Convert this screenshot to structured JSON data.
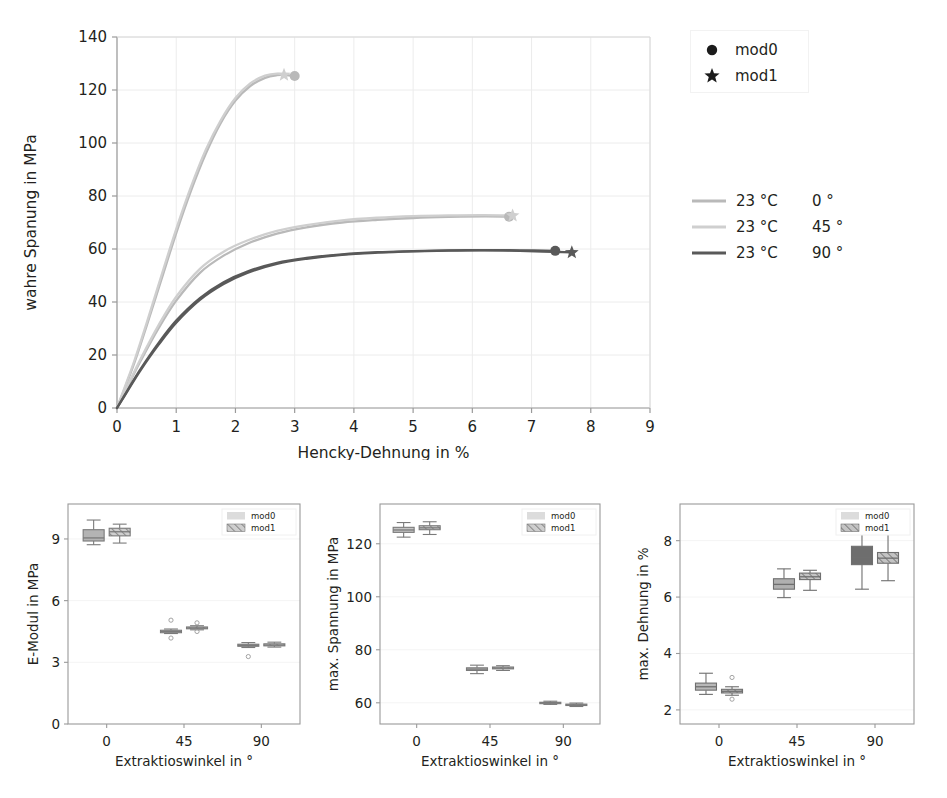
{
  "figure": {
    "kind": "multi-panel-scientific-figure",
    "panel_count": 4
  },
  "chart_data": [
    {
      "id": "stress-strain",
      "type": "line",
      "title": "",
      "xlabel": "Hencky-Dehnung in %",
      "ylabel": "wahre Spanung in MPa",
      "xlim": [
        0,
        9
      ],
      "ylim": [
        0,
        140
      ],
      "xticks": [
        "0",
        "1",
        "2",
        "3",
        "4",
        "5",
        "6",
        "7",
        "8",
        "9"
      ],
      "yticks": [
        "0",
        "20",
        "40",
        "60",
        "80",
        "100",
        "120",
        "140"
      ],
      "grid": true,
      "legend_position": "outside-right",
      "marker_legend": [
        {
          "label": "mod0",
          "marker": "circle"
        },
        {
          "label": "mod1",
          "marker": "star"
        }
      ],
      "line_legend": [
        {
          "temp": "23 °C",
          "angle": "0 °",
          "color": "#b9b9b9"
        },
        {
          "temp": "23 °C",
          "angle": "45 °",
          "color": "#cfcfcf"
        },
        {
          "temp": "23 °C",
          "angle": "90 °",
          "color": "#595959"
        }
      ],
      "series": [
        {
          "name": "23 °C 0° mod0",
          "color": "#b9b9b9",
          "end_marker": "circle",
          "end_point": {
            "x": 3.0,
            "y": 125.3
          },
          "x": [
            0,
            0.15,
            0.3,
            0.5,
            0.75,
            1.0,
            1.25,
            1.5,
            1.75,
            2.0,
            2.25,
            2.5,
            2.7,
            2.85,
            3.0
          ],
          "y": [
            0,
            8.5,
            17.5,
            31.0,
            48.5,
            66.0,
            82.0,
            96.0,
            107.5,
            116.0,
            121.5,
            124.6,
            125.6,
            125.6,
            125.3
          ]
        },
        {
          "name": "23 °C 0° mod1",
          "color": "#cfcfcf",
          "end_marker": "star",
          "end_point": {
            "x": 2.82,
            "y": 125.7
          },
          "x": [
            0,
            0.15,
            0.3,
            0.5,
            0.75,
            1.0,
            1.25,
            1.5,
            1.75,
            2.0,
            2.25,
            2.5,
            2.7,
            2.82
          ],
          "y": [
            0,
            9.0,
            18.3,
            32.0,
            50.0,
            67.5,
            83.5,
            97.5,
            108.5,
            117.0,
            122.5,
            125.4,
            126.2,
            125.7
          ]
        },
        {
          "name": "23 °C 45° mod0",
          "color": "#b9b9b9",
          "end_marker": "circle",
          "end_point": {
            "x": 6.62,
            "y": 72.2
          },
          "x": [
            0,
            0.2,
            0.4,
            0.7,
            1.0,
            1.4,
            1.8,
            2.2,
            2.7,
            3.2,
            3.8,
            4.4,
            5.0,
            5.6,
            6.2,
            6.62
          ],
          "y": [
            0,
            9.0,
            17.8,
            30.0,
            40.5,
            51.0,
            57.5,
            62.0,
            65.8,
            68.2,
            70.0,
            71.0,
            71.7,
            72.1,
            72.3,
            72.2
          ]
        },
        {
          "name": "23 °C 45° mod1",
          "color": "#cfcfcf",
          "end_marker": "star",
          "end_point": {
            "x": 6.68,
            "y": 72.6
          },
          "x": [
            0,
            0.2,
            0.4,
            0.7,
            1.0,
            1.4,
            1.8,
            2.2,
            2.7,
            3.2,
            3.8,
            4.4,
            5.0,
            5.6,
            6.2,
            6.68
          ],
          "y": [
            0,
            9.4,
            18.6,
            31.2,
            42.0,
            52.5,
            59.0,
            63.2,
            66.8,
            69.0,
            70.8,
            71.8,
            72.4,
            72.7,
            72.8,
            72.6
          ]
        },
        {
          "name": "23 °C 90° mod0",
          "color": "#595959",
          "end_marker": "circle",
          "end_point": {
            "x": 7.4,
            "y": 59.3
          },
          "x": [
            0,
            0.2,
            0.4,
            0.7,
            1.0,
            1.4,
            1.8,
            2.2,
            2.7,
            3.2,
            3.8,
            4.4,
            5.0,
            5.6,
            6.2,
            6.8,
            7.4
          ],
          "y": [
            0,
            7.5,
            14.8,
            24.5,
            33.0,
            41.5,
            47.5,
            51.5,
            54.8,
            56.6,
            58.0,
            58.8,
            59.2,
            59.5,
            59.6,
            59.5,
            59.3
          ]
        },
        {
          "name": "23 °C 90° mod1",
          "color": "#595959",
          "end_marker": "star",
          "end_point": {
            "x": 7.68,
            "y": 58.7
          },
          "x": [
            0,
            0.2,
            0.4,
            0.7,
            1.0,
            1.4,
            1.8,
            2.2,
            2.7,
            3.2,
            3.8,
            4.4,
            5.0,
            5.6,
            6.2,
            6.8,
            7.68
          ],
          "y": [
            0,
            7.2,
            14.3,
            23.8,
            32.2,
            40.8,
            46.8,
            51.0,
            54.4,
            56.3,
            57.8,
            58.6,
            59.1,
            59.4,
            59.5,
            59.3,
            58.7
          ]
        }
      ]
    },
    {
      "id": "e-modul",
      "type": "box",
      "xlabel": "Extraktioswinkel in °",
      "ylabel": "E-Modul in MPa",
      "xticks": [
        "0",
        "45",
        "90"
      ],
      "yticks": [
        "0",
        "3",
        "6",
        "9"
      ],
      "ylim": [
        0,
        10.7
      ],
      "legend": [
        {
          "label": "mod0",
          "fill": "solid"
        },
        {
          "label": "mod1",
          "fill": "hatched"
        }
      ],
      "boxes": [
        {
          "group": "0",
          "series": "mod0",
          "whislo": 8.72,
          "q1": 8.9,
          "med": 9.05,
          "q3": 9.45,
          "whishi": 9.92,
          "fliers": []
        },
        {
          "group": "0",
          "series": "mod1",
          "whislo": 8.8,
          "q1": 9.15,
          "med": 9.35,
          "q3": 9.52,
          "whishi": 9.72,
          "fliers": []
        },
        {
          "group": "45",
          "series": "mod0",
          "whislo": 4.4,
          "q1": 4.44,
          "med": 4.5,
          "q3": 4.56,
          "whishi": 4.62,
          "fliers": [
            5.05,
            4.18
          ]
        },
        {
          "group": "45",
          "series": "mod1",
          "whislo": 4.58,
          "q1": 4.63,
          "med": 4.67,
          "q3": 4.72,
          "whishi": 4.78,
          "fliers": [
            4.92,
            4.5
          ]
        },
        {
          "group": "90",
          "series": "mod0",
          "whislo": 3.72,
          "q1": 3.78,
          "med": 3.82,
          "q3": 3.88,
          "whishi": 3.96,
          "fliers": [
            3.28
          ]
        },
        {
          "group": "90",
          "series": "mod1",
          "whislo": 3.74,
          "q1": 3.8,
          "med": 3.84,
          "q3": 3.9,
          "whishi": 3.98,
          "fliers": []
        }
      ]
    },
    {
      "id": "max-spannung",
      "type": "box",
      "xlabel": "Extraktioswinkel in °",
      "ylabel": "max. Spannung in MPa",
      "xticks": [
        "0",
        "45",
        "90"
      ],
      "yticks": [
        "60",
        "80",
        "100",
        "120"
      ],
      "ylim": [
        52,
        135
      ],
      "legend": [
        {
          "label": "mod0",
          "fill": "solid"
        },
        {
          "label": "mod1",
          "fill": "hatched"
        }
      ],
      "boxes": [
        {
          "group": "0",
          "series": "mod0",
          "whislo": 122.5,
          "q1": 124.3,
          "med": 125.2,
          "q3": 126.2,
          "whishi": 128.0,
          "fliers": []
        },
        {
          "group": "0",
          "series": "mod1",
          "whislo": 123.5,
          "q1": 125.3,
          "med": 126.0,
          "q3": 126.8,
          "whishi": 128.3,
          "fliers": []
        },
        {
          "group": "45",
          "series": "mod0",
          "whislo": 71.0,
          "q1": 72.2,
          "med": 72.7,
          "q3": 73.2,
          "whishi": 74.2,
          "fliers": []
        },
        {
          "group": "45",
          "series": "mod1",
          "whislo": 72.2,
          "q1": 72.8,
          "med": 73.1,
          "q3": 73.5,
          "whishi": 74.0,
          "fliers": []
        },
        {
          "group": "90",
          "series": "mod0",
          "whislo": 59.4,
          "q1": 59.8,
          "med": 60.0,
          "q3": 60.2,
          "whishi": 60.6,
          "fliers": []
        },
        {
          "group": "90",
          "series": "mod1",
          "whislo": 58.6,
          "q1": 59.0,
          "med": 59.2,
          "q3": 59.5,
          "whishi": 59.9,
          "fliers": []
        }
      ]
    },
    {
      "id": "max-dehnung",
      "type": "box",
      "xlabel": "Extraktioswinkel in °",
      "ylabel": "max. Dehnung in %",
      "xticks": [
        "0",
        "45",
        "90"
      ],
      "yticks": [
        "2",
        "4",
        "6",
        "8"
      ],
      "ylim": [
        1.5,
        9.3
      ],
      "legend": [
        {
          "label": "mod0",
          "fill": "solid"
        },
        {
          "label": "mod1",
          "fill": "hatched"
        }
      ],
      "boxes": [
        {
          "group": "0",
          "series": "mod0",
          "whislo": 2.55,
          "q1": 2.7,
          "med": 2.82,
          "q3": 2.95,
          "whishi": 3.3,
          "fliers": []
        },
        {
          "group": "0",
          "series": "mod1",
          "whislo": 2.52,
          "q1": 2.6,
          "med": 2.66,
          "q3": 2.73,
          "whishi": 2.82,
          "fliers": [
            3.15,
            2.38
          ]
        },
        {
          "group": "45",
          "series": "mod0",
          "whislo": 5.98,
          "q1": 6.28,
          "med": 6.45,
          "q3": 6.65,
          "whishi": 7.0,
          "fliers": []
        },
        {
          "group": "45",
          "series": "mod1",
          "whislo": 6.24,
          "q1": 6.62,
          "med": 6.72,
          "q3": 6.85,
          "whishi": 6.95,
          "fliers": []
        },
        {
          "group": "90",
          "series": "mod0",
          "whislo": 6.28,
          "q1": 7.15,
          "med": 7.42,
          "q3": 7.8,
          "whishi": 8.38,
          "fliers": []
        },
        {
          "group": "90",
          "series": "mod1",
          "whislo": 6.58,
          "q1": 7.2,
          "med": 7.38,
          "q3": 7.58,
          "whishi": 8.3,
          "fliers": []
        }
      ]
    }
  ],
  "colors": {
    "line_0deg": "#b9b9b9",
    "line_45deg": "#cfcfcf",
    "line_90deg": "#595959",
    "box_light": "#b0b0b0",
    "box_mid": "#9a9a9a",
    "box_dark": "#6e6e6e",
    "axis": "#9a9a9a",
    "grid": "#ececec",
    "text": "#231f20"
  }
}
